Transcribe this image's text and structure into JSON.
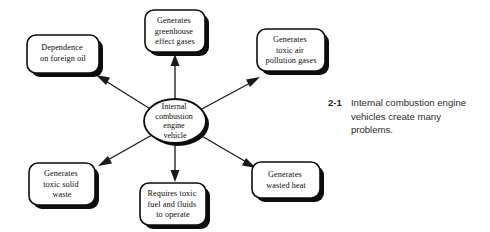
{
  "figure": {
    "caption_number": "2-1",
    "caption_text": "Internal combustion engine vehicles create many problems."
  },
  "diagram": {
    "type": "radial-spider",
    "center": {
      "label": "Internal combustion engine vehicle",
      "lines": [
        "Internal",
        "combustion",
        "engine",
        "vehicle"
      ]
    },
    "nodes": [
      {
        "id": "dependence-foreign-oil",
        "label": "Dependence on foreign oil",
        "lines": [
          "Dependence",
          "on foreign oil"
        ]
      },
      {
        "id": "greenhouse-effect-gases",
        "label": "Generates greenhouse effect gases",
        "lines": [
          "Generates",
          "greenhouse",
          "effect gases"
        ]
      },
      {
        "id": "toxic-air-pollution-gases",
        "label": "Generates toxic air pollution gases",
        "lines": [
          "Generates",
          "toxic air",
          "pollution gases"
        ]
      },
      {
        "id": "wasted-heat",
        "label": "Generates wasted heat",
        "lines": [
          "Generates",
          "wasted heat"
        ]
      },
      {
        "id": "toxic-fuel-fluids",
        "label": "Requires toxic fuel and fluids to operate",
        "lines": [
          "Requires toxic",
          "fuel and fluids",
          "to operate"
        ]
      },
      {
        "id": "toxic-solid-waste",
        "label": "Generates toxic solid waste",
        "lines": [
          "Generates",
          "toxic solid",
          "waste"
        ]
      }
    ],
    "colors": {
      "node_fill": "#ffffff",
      "node_stroke": "#0d0d0d",
      "shadow": "#0d0d0d",
      "connector": "#1a1a1a",
      "background": "#ffffff",
      "caption_text": "#2a2a2a"
    }
  }
}
